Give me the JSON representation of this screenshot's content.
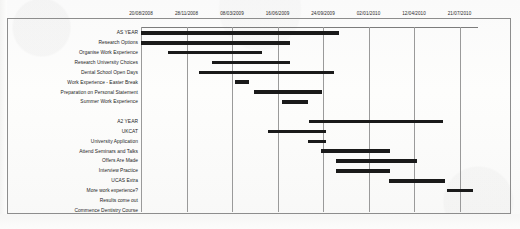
{
  "chart_data": {
    "type": "bar",
    "chart_subtype": "gantt",
    "title": "",
    "xlabel": "",
    "ylabel": "",
    "grid": true,
    "legend": "none",
    "axis_position": "top",
    "xlim": [
      "20/08/2008",
      "21/07/2010"
    ],
    "tick_labels": [
      "20/08/2008",
      "28/11/2008",
      "08/03/2009",
      "16/06/2009",
      "24/09/2009",
      "02/01/2010",
      "12/04/2010",
      "21/07/2010"
    ],
    "tick_positions_px": [
      0,
      45.5,
      91,
      136.5,
      182,
      227.5,
      273,
      318.5
    ],
    "categories": [
      "AS YEAR",
      "Research Options",
      "Organise Work Experience",
      "Research University Choices",
      "Dental School Open Days",
      "Work Experience - Easter Break",
      "Preparation on Personal Statement",
      "Summer Work Experience",
      "",
      "A2 YEAR",
      "UKCAT",
      "University Application",
      "Attend Seminars and Talks",
      "Offers Are Made",
      "Interview Practice",
      "UCAS Extra",
      "More work experience?",
      "Results come out",
      "Commence Dentistry Course"
    ],
    "tasks": [
      {
        "label": "AS YEAR",
        "start_px": 0,
        "end_px": 198,
        "start_date": "20/08/2008",
        "end_date": "05/08/2009"
      },
      {
        "label": "Research Options",
        "start_px": 0,
        "end_px": 149,
        "start_date": "20/08/2008",
        "end_date": "16/05/2009"
      },
      {
        "label": "Organise Work Experience",
        "start_px": 27,
        "end_px": 121,
        "start_date": "05/10/2008",
        "end_date": "04/04/2009"
      },
      {
        "label": "Research University Choices",
        "start_px": 71,
        "end_px": 149,
        "start_date": "16/01/2009",
        "end_date": "16/05/2009"
      },
      {
        "label": "Dental School Open Days",
        "start_px": 58,
        "end_px": 193,
        "start_date": "26/12/2008",
        "end_date": "26/07/2009"
      },
      {
        "label": "Work Experience - Easter Break",
        "start_px": 94,
        "end_px": 108,
        "start_date": "07/04/2009",
        "end_date": "03/05/2009"
      },
      {
        "label": "Preparation on Personal Statement",
        "start_px": 113,
        "end_px": 181,
        "start_date": "15/05/2009",
        "end_date": "06/09/2009"
      },
      {
        "label": "Summer Work Experience",
        "start_px": 141,
        "end_px": 167,
        "start_date": "08/07/2009",
        "end_date": "11/08/2009"
      },
      {
        "label": "A2 YEAR",
        "start_px": 168,
        "end_px": 302,
        "start_date": "14/08/2009",
        "end_date": "01/08/2010"
      },
      {
        "label": "UKCAT",
        "start_px": 127,
        "end_px": 185,
        "start_date": "02/06/2009",
        "end_date": "14/09/2009"
      },
      {
        "label": "University Application",
        "start_px": 167,
        "end_px": 185,
        "start_date": "11/08/2009",
        "end_date": "14/09/2009"
      },
      {
        "label": "Attend Seminars and Talks",
        "start_px": 180,
        "end_px": 249,
        "start_date": "02/09/2009",
        "end_date": "10/01/2010"
      },
      {
        "label": "Offers Are Made",
        "start_px": 195,
        "end_px": 276,
        "start_date": "01/10/2009",
        "end_date": "02/03/2010"
      },
      {
        "label": "Interview Practice",
        "start_px": 195,
        "end_px": 249,
        "start_date": "01/10/2009",
        "end_date": "10/01/2010"
      },
      {
        "label": "UCAS Extra",
        "start_px": 248,
        "end_px": 304,
        "start_date": "08/01/2010",
        "end_date": "04/08/2010"
      },
      {
        "label": "More work experience?",
        "start_px": 306,
        "end_px": 332,
        "start_date": "08/08/2010",
        "end_date": "12/09/2010"
      },
      {
        "label": "Results come out",
        "start_px": 0,
        "end_px": 0,
        "start_date": "",
        "end_date": ""
      },
      {
        "label": "Commence Dentistry Course",
        "start_px": 0,
        "end_px": 0,
        "start_date": "",
        "end_date": ""
      }
    ]
  }
}
